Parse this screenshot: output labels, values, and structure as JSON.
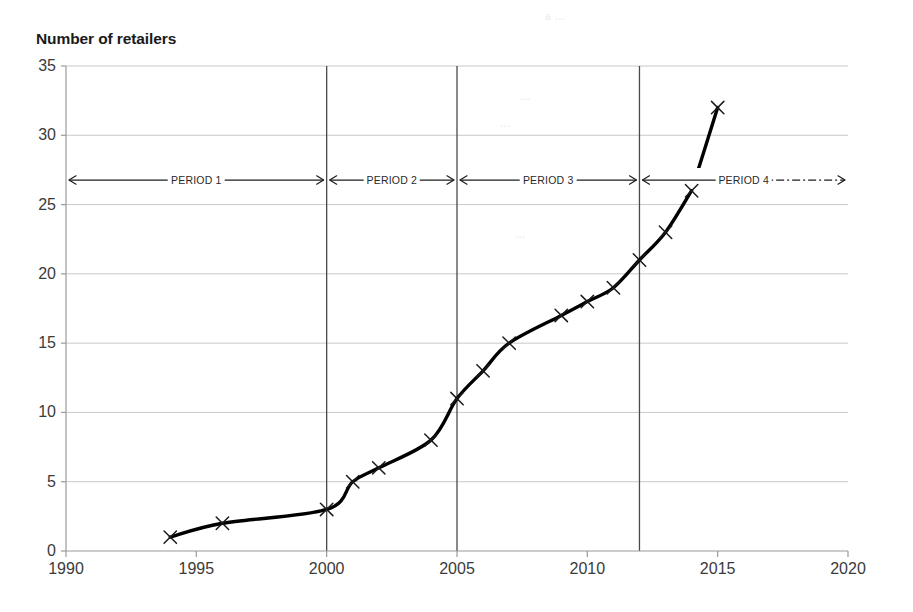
{
  "chart_data": {
    "type": "line",
    "title": "Number of retailers",
    "xlabel": "",
    "ylabel": "Number of retailers",
    "xlim": [
      1990,
      2020
    ],
    "ylim": [
      0,
      35
    ],
    "xticks": [
      1990,
      1995,
      2000,
      2005,
      2010,
      2015,
      2020
    ],
    "yticks": [
      0,
      5,
      10,
      15,
      20,
      25,
      30,
      35
    ],
    "grid": "horizontal",
    "legend": "none",
    "x": [
      1994,
      1996,
      2000,
      2001,
      2002,
      2004,
      2005,
      2006,
      2007,
      2009,
      2010,
      2011,
      2012,
      2013,
      2014,
      2015
    ],
    "values": [
      1,
      2,
      3,
      5,
      6,
      8,
      11,
      13,
      15,
      17,
      18,
      19,
      21,
      23,
      26,
      32
    ],
    "marker": "x",
    "line_color": "#000000",
    "annotations": [
      {
        "label": "PERIOD 1",
        "start": 1990,
        "end": 2000,
        "arrow": "double"
      },
      {
        "label": "PERIOD 2",
        "start": 2000,
        "end": 2005,
        "arrow": "double"
      },
      {
        "label": "PERIOD 3",
        "start": 2005,
        "end": 2012,
        "arrow": "double"
      },
      {
        "label": "PERIOD 4",
        "start": 2012,
        "end": 2020,
        "arrow": "double-dashed-right"
      }
    ],
    "dividers": [
      2000,
      2005,
      2012
    ]
  },
  "axis": {
    "y_title": "Number of retailers",
    "y_tick_labels": [
      "35",
      "30",
      "25",
      "20",
      "15",
      "10",
      "5",
      "0"
    ],
    "x_tick_labels": [
      "1990",
      "1995",
      "2000",
      "2005",
      "2010",
      "2015",
      "2020"
    ]
  },
  "periods": {
    "p1": "PERIOD 1",
    "p2": "PERIOD 2",
    "p3": "PERIOD 3",
    "p4": "PERIOD 4"
  },
  "colors": {
    "line": "#000000",
    "gridline": "#c9c9c9",
    "divider": "#4a4a4a",
    "text": "#3b3b3b"
  },
  "ghost_text": {
    "g1": "a  ...",
    "g2": "...",
    "g3": "...",
    "g4": "..."
  }
}
